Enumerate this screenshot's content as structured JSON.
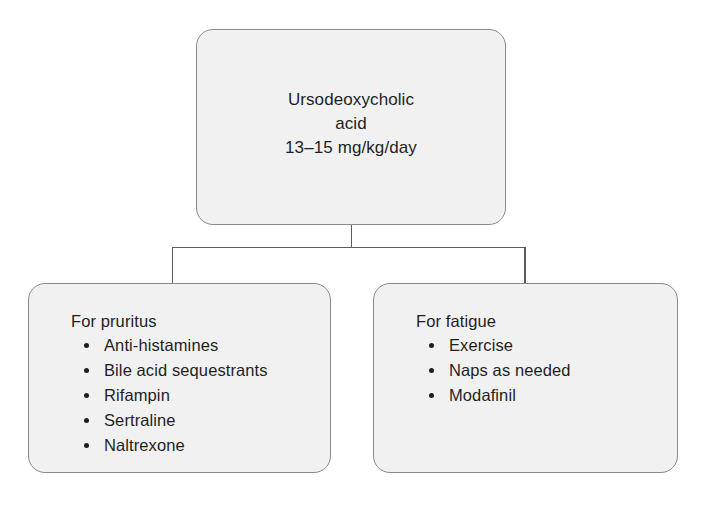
{
  "diagram": {
    "type": "flowchart",
    "background_color": "#ffffff",
    "node_fill_color": "#f1f1f1",
    "node_border_color": "#8a8a8a",
    "connector_color": "#5c5c5c",
    "text_color": "#1f1f1f",
    "root": {
      "text": "Ursodeoxycholic\nacid\n13–15 mg/kg/day",
      "line1": "Ursodeoxycholic",
      "line2": "acid",
      "line3": "13–15 mg/kg/day",
      "drug": "Ursodeoxycholic acid",
      "dose": "13–15 mg/kg/day"
    },
    "branches": [
      {
        "heading": "For pruritus",
        "items": [
          "Anti-histamines",
          "Bile acid sequestrants",
          "Rifampin",
          "Sertraline",
          "Naltrexone"
        ]
      },
      {
        "heading": "For fatigue",
        "items": [
          "Exercise",
          "Naps as needed",
          "Modafinil"
        ]
      }
    ]
  }
}
